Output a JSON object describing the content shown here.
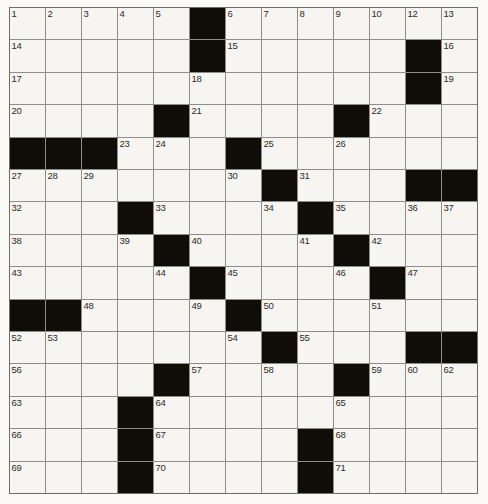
{
  "puzzle": {
    "title": "Crossword Puzzle Grid",
    "columns": 13,
    "rows": 15,
    "colors": {
      "block": "#100c08",
      "cell": "#f7f5f1",
      "grid_line": "#8e8d8a",
      "number_text": "#2e2c2a",
      "page_background": "#ffffff"
    },
    "grid": [
      [
        {
          "type": "cell",
          "number": "1"
        },
        {
          "type": "cell",
          "number": "2"
        },
        {
          "type": "cell",
          "number": "3"
        },
        {
          "type": "cell",
          "number": "4"
        },
        {
          "type": "cell",
          "number": "5"
        },
        {
          "type": "block",
          "number": ""
        },
        {
          "type": "cell",
          "number": "6"
        },
        {
          "type": "cell",
          "number": "7"
        },
        {
          "type": "cell",
          "number": "8"
        },
        {
          "type": "cell",
          "number": "9"
        },
        {
          "type": "cell",
          "number": "10"
        },
        {
          "type": "block",
          "number": ""
        },
        {
          "type": "cell",
          "number": "11"
        }
      ],
      [
        {
          "type": "cell",
          "number": "14"
        },
        {
          "type": "cell",
          "number": ""
        },
        {
          "type": "cell",
          "number": ""
        },
        {
          "type": "cell",
          "number": ""
        },
        {
          "type": "cell",
          "number": ""
        },
        {
          "type": "block",
          "number": ""
        },
        {
          "type": "cell",
          "number": "15"
        },
        {
          "type": "cell",
          "number": ""
        },
        {
          "type": "cell",
          "number": ""
        },
        {
          "type": "cell",
          "number": ""
        },
        {
          "type": "cell",
          "number": ""
        },
        {
          "type": "block",
          "number": ""
        },
        {
          "type": "cell",
          "number": "16"
        }
      ],
      [
        {
          "type": "cell",
          "number": "17"
        },
        {
          "type": "cell",
          "number": ""
        },
        {
          "type": "cell",
          "number": ""
        },
        {
          "type": "cell",
          "number": ""
        },
        {
          "type": "cell",
          "number": ""
        },
        {
          "type": "cell",
          "number": "18"
        },
        {
          "type": "cell",
          "number": ""
        },
        {
          "type": "cell",
          "number": ""
        },
        {
          "type": "cell",
          "number": ""
        },
        {
          "type": "cell",
          "number": ""
        },
        {
          "type": "cell",
          "number": ""
        },
        {
          "type": "block",
          "number": ""
        },
        {
          "type": "cell",
          "number": "19"
        }
      ],
      [
        {
          "type": "cell",
          "number": "20"
        },
        {
          "type": "cell",
          "number": ""
        },
        {
          "type": "cell",
          "number": ""
        },
        {
          "type": "cell",
          "number": ""
        },
        {
          "type": "block",
          "number": ""
        },
        {
          "type": "cell",
          "number": "21"
        },
        {
          "type": "cell",
          "number": ""
        },
        {
          "type": "cell",
          "number": ""
        },
        {
          "type": "cell",
          "number": ""
        },
        {
          "type": "block",
          "number": ""
        },
        {
          "type": "cell",
          "number": "22"
        },
        {
          "type": "cell",
          "number": ""
        },
        {
          "type": "cell",
          "number": ""
        }
      ],
      [
        {
          "type": "block",
          "number": ""
        },
        {
          "type": "block",
          "number": ""
        },
        {
          "type": "block",
          "number": ""
        },
        {
          "type": "cell",
          "number": "23"
        },
        {
          "type": "cell",
          "number": "24"
        },
        {
          "type": "cell",
          "number": ""
        },
        {
          "type": "block",
          "number": ""
        },
        {
          "type": "cell",
          "number": "25"
        },
        {
          "type": "cell",
          "number": ""
        },
        {
          "type": "cell",
          "number": "26"
        },
        {
          "type": "cell",
          "number": ""
        },
        {
          "type": "cell",
          "number": ""
        },
        {
          "type": "cell",
          "number": ""
        }
      ],
      [
        {
          "type": "cell",
          "number": "27"
        },
        {
          "type": "cell",
          "number": "28"
        },
        {
          "type": "cell",
          "number": "29"
        },
        {
          "type": "cell",
          "number": ""
        },
        {
          "type": "cell",
          "number": ""
        },
        {
          "type": "cell",
          "number": ""
        },
        {
          "type": "cell",
          "number": "30"
        },
        {
          "type": "block",
          "number": ""
        },
        {
          "type": "cell",
          "number": "31"
        },
        {
          "type": "cell",
          "number": ""
        },
        {
          "type": "cell",
          "number": ""
        },
        {
          "type": "block",
          "number": ""
        },
        {
          "type": "block",
          "number": ""
        }
      ],
      [
        {
          "type": "cell",
          "number": "32"
        },
        {
          "type": "cell",
          "number": ""
        },
        {
          "type": "cell",
          "number": ""
        },
        {
          "type": "block",
          "number": ""
        },
        {
          "type": "cell",
          "number": "33"
        },
        {
          "type": "cell",
          "number": ""
        },
        {
          "type": "cell",
          "number": ""
        },
        {
          "type": "cell",
          "number": "34"
        },
        {
          "type": "block",
          "number": ""
        },
        {
          "type": "cell",
          "number": "35"
        },
        {
          "type": "cell",
          "number": ""
        },
        {
          "type": "cell",
          "number": "36"
        },
        {
          "type": "cell",
          "number": "37"
        }
      ],
      [
        {
          "type": "cell",
          "number": "38"
        },
        {
          "type": "cell",
          "number": ""
        },
        {
          "type": "cell",
          "number": ""
        },
        {
          "type": "cell",
          "number": "39"
        },
        {
          "type": "block",
          "number": ""
        },
        {
          "type": "cell",
          "number": "40"
        },
        {
          "type": "cell",
          "number": ""
        },
        {
          "type": "cell",
          "number": ""
        },
        {
          "type": "cell",
          "number": "41"
        },
        {
          "type": "block",
          "number": ""
        },
        {
          "type": "cell",
          "number": "42"
        },
        {
          "type": "cell",
          "number": ""
        },
        {
          "type": "cell",
          "number": ""
        }
      ],
      [
        {
          "type": "cell",
          "number": "43"
        },
        {
          "type": "cell",
          "number": ""
        },
        {
          "type": "cell",
          "number": ""
        },
        {
          "type": "cell",
          "number": ""
        },
        {
          "type": "cell",
          "number": "44"
        },
        {
          "type": "block",
          "number": ""
        },
        {
          "type": "cell",
          "number": "45"
        },
        {
          "type": "cell",
          "number": ""
        },
        {
          "type": "cell",
          "number": ""
        },
        {
          "type": "cell",
          "number": "46"
        },
        {
          "type": "block",
          "number": ""
        },
        {
          "type": "cell",
          "number": "47"
        },
        {
          "type": "cell",
          "number": ""
        }
      ],
      [
        {
          "type": "block",
          "number": ""
        },
        {
          "type": "block",
          "number": ""
        },
        {
          "type": "cell",
          "number": "48"
        },
        {
          "type": "cell",
          "number": ""
        },
        {
          "type": "cell",
          "number": ""
        },
        {
          "type": "cell",
          "number": "49"
        },
        {
          "type": "block",
          "number": ""
        },
        {
          "type": "cell",
          "number": "50"
        },
        {
          "type": "cell",
          "number": ""
        },
        {
          "type": "cell",
          "number": ""
        },
        {
          "type": "cell",
          "number": "51"
        },
        {
          "type": "cell",
          "number": ""
        },
        {
          "type": "cell",
          "number": ""
        }
      ],
      [
        {
          "type": "cell",
          "number": "52"
        },
        {
          "type": "cell",
          "number": "53"
        },
        {
          "type": "cell",
          "number": ""
        },
        {
          "type": "cell",
          "number": ""
        },
        {
          "type": "cell",
          "number": ""
        },
        {
          "type": "cell",
          "number": ""
        },
        {
          "type": "cell",
          "number": "54"
        },
        {
          "type": "block",
          "number": ""
        },
        {
          "type": "cell",
          "number": "55"
        },
        {
          "type": "cell",
          "number": ""
        },
        {
          "type": "cell",
          "number": ""
        },
        {
          "type": "block",
          "number": ""
        },
        {
          "type": "block",
          "number": ""
        }
      ],
      [
        {
          "type": "cell",
          "number": "56"
        },
        {
          "type": "cell",
          "number": ""
        },
        {
          "type": "cell",
          "number": ""
        },
        {
          "type": "cell",
          "number": ""
        },
        {
          "type": "block",
          "number": ""
        },
        {
          "type": "cell",
          "number": "57"
        },
        {
          "type": "cell",
          "number": ""
        },
        {
          "type": "cell",
          "number": "58"
        },
        {
          "type": "cell",
          "number": ""
        },
        {
          "type": "block",
          "number": ""
        },
        {
          "type": "cell",
          "number": "59"
        },
        {
          "type": "cell",
          "number": "60"
        },
        {
          "type": "cell",
          "number": "61"
        }
      ],
      [
        {
          "type": "cell",
          "number": "63"
        },
        {
          "type": "cell",
          "number": ""
        },
        {
          "type": "cell",
          "number": ""
        },
        {
          "type": "block",
          "number": ""
        },
        {
          "type": "cell",
          "number": "64"
        },
        {
          "type": "cell",
          "number": ""
        },
        {
          "type": "cell",
          "number": ""
        },
        {
          "type": "cell",
          "number": ""
        },
        {
          "type": "cell",
          "number": ""
        },
        {
          "type": "cell",
          "number": "65"
        },
        {
          "type": "cell",
          "number": ""
        },
        {
          "type": "cell",
          "number": ""
        },
        {
          "type": "cell",
          "number": ""
        }
      ],
      [
        {
          "type": "cell",
          "number": "66"
        },
        {
          "type": "cell",
          "number": ""
        },
        {
          "type": "cell",
          "number": ""
        },
        {
          "type": "block",
          "number": ""
        },
        {
          "type": "cell",
          "number": "67"
        },
        {
          "type": "cell",
          "number": ""
        },
        {
          "type": "cell",
          "number": ""
        },
        {
          "type": "cell",
          "number": ""
        },
        {
          "type": "block",
          "number": ""
        },
        {
          "type": "cell",
          "number": "68"
        },
        {
          "type": "cell",
          "number": ""
        },
        {
          "type": "cell",
          "number": ""
        },
        {
          "type": "cell",
          "number": ""
        }
      ],
      [
        {
          "type": "cell",
          "number": "69"
        },
        {
          "type": "cell",
          "number": ""
        },
        {
          "type": "cell",
          "number": ""
        },
        {
          "type": "block",
          "number": ""
        },
        {
          "type": "cell",
          "number": "70"
        },
        {
          "type": "cell",
          "number": ""
        },
        {
          "type": "cell",
          "number": ""
        },
        {
          "type": "cell",
          "number": ""
        },
        {
          "type": "block",
          "number": ""
        },
        {
          "type": "cell",
          "number": "71"
        },
        {
          "type": "cell",
          "number": ""
        },
        {
          "type": "cell",
          "number": ""
        },
        {
          "type": "cell",
          "number": ""
        }
      ]
    ],
    "grid_overrides": {
      "note_row1_right": "columns 11-12 of row 1 carry numbers 12 and 13",
      "row1_c11": "12",
      "row1_c12": "13",
      "row12_c12": "62"
    }
  }
}
